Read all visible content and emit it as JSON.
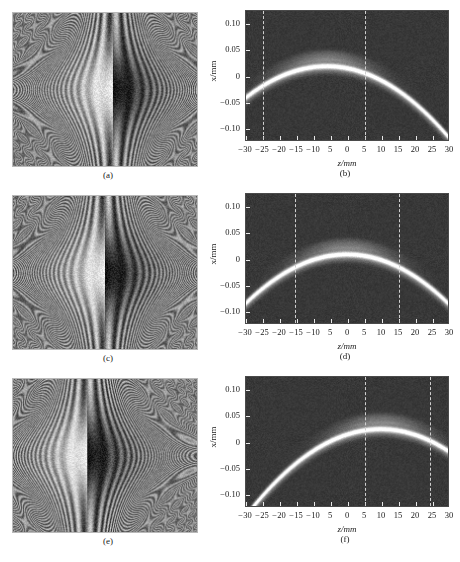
{
  "figure": {
    "layout": "3 rows x 2 columns",
    "footer_caption": ""
  },
  "axes": {
    "xlabel": "z/mm",
    "ylabel": "x/mm",
    "xticklabels": [
      "-30",
      "-25",
      "-20",
      "-15",
      "-10",
      "5",
      "0",
      "5",
      "10",
      "15",
      "20",
      "25",
      "30"
    ],
    "yticklabels": [
      "0.10",
      "0.05",
      "0",
      "-0.05",
      "-0.10"
    ],
    "xlim": [
      -30,
      30
    ],
    "ylim": [
      -0.125,
      0.125
    ],
    "xticks": [
      -30,
      -25,
      -20,
      -15,
      -10,
      -5,
      0,
      5,
      10,
      15,
      20,
      25,
      30
    ],
    "yticks": [
      0.1,
      0.05,
      0,
      -0.05,
      -0.1
    ]
  },
  "panels": [
    {
      "id": "a",
      "label": "(a)",
      "type": "hologram",
      "center_x": 0.54,
      "center_y": 0.5,
      "lobe_w": 0.175,
      "lobe_h": 0.3
    },
    {
      "id": "b",
      "label": "(b)",
      "type": "bscan",
      "apex_z": -6.0,
      "apex_x": 0.018,
      "curvature": 0.000105,
      "dashed_lines_z": [
        -25.0,
        5.0
      ]
    },
    {
      "id": "c",
      "label": "(c)",
      "type": "hologram",
      "center_x": 0.5,
      "center_y": 0.5,
      "lobe_w": 0.175,
      "lobe_h": 0.3
    },
    {
      "id": "d",
      "label": "(d)",
      "type": "bscan",
      "apex_z": 0.0,
      "apex_x": 0.008,
      "curvature": 0.000105,
      "dashed_lines_z": [
        -15.5,
        15.0
      ]
    },
    {
      "id": "e",
      "label": "(e)",
      "type": "hologram",
      "center_x": 0.4,
      "center_y": 0.5,
      "lobe_w": 0.175,
      "lobe_h": 0.3
    },
    {
      "id": "f",
      "label": "(f)",
      "type": "bscan",
      "apex_z": 10.0,
      "apex_x": 0.024,
      "curvature": 0.000105,
      "dashed_lines_z": [
        5.0,
        24.0
      ]
    }
  ],
  "chart_data": {
    "type": "heatmap",
    "title": "",
    "xlabel": "z/mm",
    "ylabel": "x/mm",
    "xlim": [
      -30,
      30
    ],
    "ylim": [
      -0.125,
      0.125
    ],
    "grid": false,
    "legend": "none",
    "subplots": [
      {
        "label": "(a)",
        "kind": "interference-fringe-hologram",
        "description": "Vertical curved fringe pattern with bright/dark bipolar lobe, lobe shifted right of center",
        "lobe_center_fraction_x": 0.54
      },
      {
        "label": "(b)",
        "kind": "reconstructed-bscan",
        "description": "Bright parabolic arc on noisy dark background with two vertical dashed markers",
        "arc_apex": {
          "z": -6.0,
          "x": 0.018
        },
        "dashed_lines_z": [
          -25.0,
          5.0
        ],
        "xticklabels": [
          "-30",
          "-25",
          "-20",
          "-15",
          "-10",
          "5",
          "0",
          "5",
          "10",
          "15",
          "20",
          "25",
          "30"
        ],
        "yticklabels": [
          "0.10",
          "0.05",
          "0",
          "-0.05",
          "-0.10"
        ]
      },
      {
        "label": "(c)",
        "kind": "interference-fringe-hologram",
        "description": "Vertical curved fringe pattern with bright/dark bipolar lobe, lobe centered",
        "lobe_center_fraction_x": 0.5
      },
      {
        "label": "(d)",
        "kind": "reconstructed-bscan",
        "description": "Bright parabolic arc centered at z=0 with two vertical dashed markers",
        "arc_apex": {
          "z": 0.0,
          "x": 0.008
        },
        "dashed_lines_z": [
          -15.5,
          15.0
        ],
        "xticklabels": [
          "-30",
          "-25",
          "-20",
          "-15",
          "-10",
          "5",
          "0",
          "5",
          "10",
          "15",
          "20",
          "25",
          "30"
        ],
        "yticklabels": [
          "0.10",
          "0.05",
          "0",
          "-0.05",
          "-0.10"
        ]
      },
      {
        "label": "(e)",
        "kind": "interference-fringe-hologram",
        "description": "Vertical curved fringe pattern with bright/dark bipolar lobe, lobe shifted left of center",
        "lobe_center_fraction_x": 0.4
      },
      {
        "label": "(f)",
        "kind": "reconstructed-bscan",
        "description": "Bright parabolic arc peaking near z=10 with two vertical dashed markers",
        "arc_apex": {
          "z": 10.0,
          "x": 0.024
        },
        "dashed_lines_z": [
          5.0,
          24.0
        ],
        "xticklabels": [
          "-30",
          "-25",
          "-20",
          "-15",
          "-10",
          "5",
          "0",
          "5",
          "10",
          "15",
          "20",
          "25",
          "30"
        ],
        "yticklabels": [
          "0.10",
          "0.05",
          "0",
          "-0.05",
          "-0.10"
        ]
      }
    ]
  }
}
